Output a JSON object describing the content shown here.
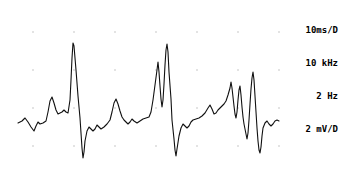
{
  "instrument": {
    "display_type": "oscilloscope-ecg-trace",
    "background_color": "#ffffff",
    "trace_color": "#101010",
    "grid_dot_color": "#b9b9b9"
  },
  "settings_panel": {
    "lines": [
      {
        "id": "timebase",
        "text": "10ms/D"
      },
      {
        "id": "sample-rate",
        "text": "10 kHz"
      },
      {
        "id": "filter-frequency",
        "text": "2 Hz"
      },
      {
        "id": "gain",
        "text": "2 mV/D"
      }
    ]
  },
  "graticule": {
    "dot_x_positions": [
      33,
      74,
      115,
      156,
      197,
      238,
      279
    ],
    "dot_y_positions": [
      32,
      70,
      108,
      146
    ],
    "dot_radius": 0.75
  },
  "chart_data": {
    "type": "line",
    "title": "",
    "xlabel": "",
    "ylabel": "",
    "xlim": [
      0,
      342
    ],
    "ylim": [
      169,
      0
    ],
    "grid": true,
    "legend": null,
    "series": [
      {
        "name": "ecg-waveform",
        "stroke": "#101010",
        "stroke_width": 1.1,
        "points": [
          [
            18,
            123
          ],
          [
            22,
            121
          ],
          [
            25,
            118
          ],
          [
            28,
            122
          ],
          [
            31,
            127
          ],
          [
            34,
            131
          ],
          [
            36,
            126
          ],
          [
            38,
            122
          ],
          [
            40,
            124
          ],
          [
            43,
            123
          ],
          [
            46,
            121
          ],
          [
            48,
            112
          ],
          [
            50,
            101
          ],
          [
            52,
            97
          ],
          [
            54,
            103
          ],
          [
            56,
            110
          ],
          [
            58,
            114
          ],
          [
            60,
            113
          ],
          [
            62,
            112
          ],
          [
            64,
            110
          ],
          [
            66,
            112
          ],
          [
            68,
            113
          ],
          [
            70,
            100
          ],
          [
            71,
            80
          ],
          [
            72,
            58
          ],
          [
            73,
            43
          ],
          [
            74,
            46
          ],
          [
            76,
            70
          ],
          [
            78,
            96
          ],
          [
            80,
            118
          ],
          [
            81,
            133
          ],
          [
            82,
            148
          ],
          [
            83,
            158
          ],
          [
            84,
            152
          ],
          [
            85,
            141
          ],
          [
            87,
            131
          ],
          [
            89,
            127
          ],
          [
            91,
            129
          ],
          [
            93,
            131
          ],
          [
            95,
            129
          ],
          [
            97,
            125
          ],
          [
            99,
            127
          ],
          [
            101,
            129
          ],
          [
            104,
            127
          ],
          [
            107,
            124
          ],
          [
            110,
            120
          ],
          [
            112,
            112
          ],
          [
            114,
            103
          ],
          [
            116,
            99
          ],
          [
            118,
            104
          ],
          [
            120,
            111
          ],
          [
            122,
            117
          ],
          [
            124,
            120
          ],
          [
            126,
            122
          ],
          [
            128,
            124
          ],
          [
            130,
            122
          ],
          [
            132,
            119
          ],
          [
            134,
            121
          ],
          [
            137,
            123
          ],
          [
            140,
            121
          ],
          [
            143,
            119
          ],
          [
            146,
            118
          ],
          [
            149,
            117
          ],
          [
            151,
            112
          ],
          [
            153,
            100
          ],
          [
            155,
            85
          ],
          [
            157,
            70
          ],
          [
            158,
            62
          ],
          [
            159,
            72
          ],
          [
            160,
            86
          ],
          [
            161,
            99
          ],
          [
            162,
            107
          ],
          [
            163,
            100
          ],
          [
            164,
            84
          ],
          [
            165,
            65
          ],
          [
            166,
            50
          ],
          [
            167,
            44
          ],
          [
            168,
            52
          ],
          [
            169,
            72
          ],
          [
            171,
            99
          ],
          [
            172,
            120
          ],
          [
            174,
            139
          ],
          [
            175,
            150
          ],
          [
            176,
            156
          ],
          [
            177,
            149
          ],
          [
            179,
            136
          ],
          [
            181,
            128
          ],
          [
            183,
            124
          ],
          [
            185,
            126
          ],
          [
            187,
            128
          ],
          [
            189,
            126
          ],
          [
            191,
            122
          ],
          [
            193,
            120
          ],
          [
            196,
            119
          ],
          [
            199,
            118
          ],
          [
            202,
            116
          ],
          [
            205,
            113
          ],
          [
            208,
            108
          ],
          [
            210,
            105
          ],
          [
            212,
            109
          ],
          [
            214,
            114
          ],
          [
            216,
            113
          ],
          [
            218,
            110
          ],
          [
            220,
            108
          ],
          [
            222,
            106
          ],
          [
            224,
            104
          ],
          [
            226,
            101
          ],
          [
            228,
            95
          ],
          [
            230,
            88
          ],
          [
            231,
            82
          ],
          [
            232,
            88
          ],
          [
            233,
            97
          ],
          [
            234,
            106
          ],
          [
            235,
            114
          ],
          [
            236,
            118
          ],
          [
            237,
            112
          ],
          [
            238,
            100
          ],
          [
            239,
            90
          ],
          [
            240,
            86
          ],
          [
            241,
            95
          ],
          [
            242,
            107
          ],
          [
            243,
            117
          ],
          [
            244,
            124
          ],
          [
            245,
            129
          ],
          [
            246,
            134
          ],
          [
            247,
            139
          ],
          [
            248,
            133
          ],
          [
            249,
            120
          ],
          [
            250,
            104
          ],
          [
            251,
            89
          ],
          [
            252,
            78
          ],
          [
            253,
            72
          ],
          [
            254,
            80
          ],
          [
            255,
            96
          ],
          [
            256,
            112
          ],
          [
            257,
            128
          ],
          [
            258,
            141
          ],
          [
            259,
            150
          ],
          [
            260,
            153
          ],
          [
            261,
            147
          ],
          [
            262,
            136
          ],
          [
            263,
            128
          ],
          [
            265,
            123
          ],
          [
            267,
            121
          ],
          [
            269,
            124
          ],
          [
            271,
            126
          ],
          [
            273,
            124
          ],
          [
            275,
            121
          ],
          [
            277,
            120
          ],
          [
            279,
            121
          ]
        ]
      }
    ]
  }
}
